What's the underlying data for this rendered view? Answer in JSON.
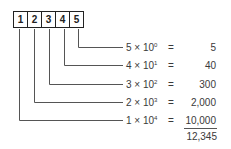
{
  "digits": [
    "1",
    "2",
    "3",
    "4",
    "5"
  ],
  "rows": [
    {
      "coef": "5",
      "times": "×",
      "base": "10",
      "exp": "0",
      "eq": "=",
      "value": "5"
    },
    {
      "coef": "4",
      "times": "×",
      "base": "10",
      "exp": "1",
      "eq": "=",
      "value": "40"
    },
    {
      "coef": "3",
      "times": "×",
      "base": "10",
      "exp": "2",
      "eq": "=",
      "value": "300"
    },
    {
      "coef": "2",
      "times": "×",
      "base": "10",
      "exp": "3",
      "eq": "=",
      "value": "2,000"
    },
    {
      "coef": "1",
      "times": "×",
      "base": "10",
      "exp": "4",
      "eq": "=",
      "value": "10,000"
    }
  ],
  "total": "12,345",
  "colors": {
    "box_border": "#222222",
    "line": "#555555",
    "text": "#3a3a3a"
  }
}
